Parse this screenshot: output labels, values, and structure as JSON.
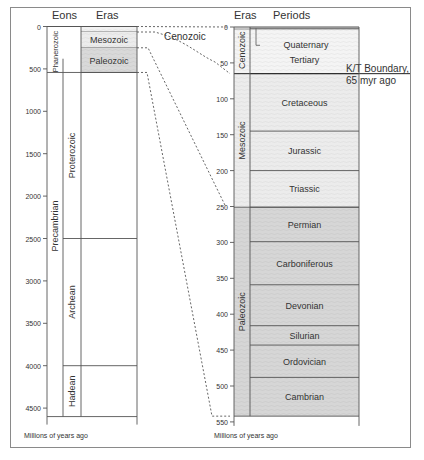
{
  "left_chart": {
    "headers": {
      "eons": "Eons",
      "eras": "Eras"
    },
    "axis_label": "Millions of years ago",
    "ticks": [
      0,
      500,
      1000,
      1500,
      2000,
      2500,
      3000,
      3500,
      4000,
      4500
    ],
    "eons": [
      {
        "name": "Phanerozoic",
        "start": 0,
        "end": 542
      },
      {
        "name": "Precambrian",
        "start": 542,
        "end": 4600
      }
    ],
    "sub_eons": [
      {
        "name": "Proterozoic",
        "start": 542,
        "end": 2500
      },
      {
        "name": "Archean",
        "start": 2500,
        "end": 4000
      },
      {
        "name": "Hadean",
        "start": 4000,
        "end": 4600
      }
    ],
    "eras": [
      {
        "name": "Cenozoic",
        "start": 0,
        "end": 65,
        "fill": "#f2f2f2"
      },
      {
        "name": "Mesozoic",
        "start": 65,
        "end": 251,
        "fill": "#ececec"
      },
      {
        "name": "Paleozoic",
        "start": 251,
        "end": 542,
        "fill": "#d9d9d9"
      }
    ],
    "callout": "Cenozoic"
  },
  "right_chart": {
    "headers": {
      "eras": "Eras",
      "periods": "Periods"
    },
    "axis_label": "Millions of years ago",
    "ticks": [
      0,
      50,
      100,
      150,
      200,
      250,
      300,
      350,
      400,
      450,
      500,
      550
    ],
    "eras": [
      {
        "name": "Cenozoic",
        "start": 0,
        "end": 65,
        "fill": "#f4f4f4"
      },
      {
        "name": "Mesozoic",
        "start": 65,
        "end": 251,
        "fill": "#ececec"
      },
      {
        "name": "Paleozoic",
        "start": 251,
        "end": 542,
        "fill": "#d6d6d6"
      }
    ],
    "periods": [
      {
        "name": "Quaternary",
        "start": 0,
        "end": 1.8
      },
      {
        "name": "Tertiary",
        "start": 1.8,
        "end": 65
      },
      {
        "name": "Cretaceous",
        "start": 65,
        "end": 145
      },
      {
        "name": "Jurassic",
        "start": 145,
        "end": 200
      },
      {
        "name": "Triassic",
        "start": 200,
        "end": 251
      },
      {
        "name": "Permian",
        "start": 251,
        "end": 299
      },
      {
        "name": "Carboniferous",
        "start": 299,
        "end": 359
      },
      {
        "name": "Devonian",
        "start": 359,
        "end": 416
      },
      {
        "name": "Silurian",
        "start": 416,
        "end": 443
      },
      {
        "name": "Ordovician",
        "start": 443,
        "end": 488
      },
      {
        "name": "Cambrian",
        "start": 488,
        "end": 542
      }
    ],
    "annotation": {
      "line1": "K/T Boundary,",
      "line2": "65 myr ago",
      "at": 65
    }
  },
  "colors": {
    "line": "#555555",
    "text": "#333333",
    "frame": "#8a8a8a"
  }
}
